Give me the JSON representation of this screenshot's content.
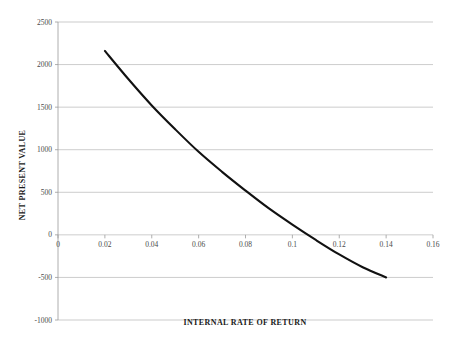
{
  "chart_data": {
    "type": "line",
    "title": "",
    "xlabel": "INTERNAL RATE OF RETURN",
    "ylabel": "NET PRESENT VALUE",
    "xlim": [
      0,
      0.16
    ],
    "ylim": [
      -1000,
      2500
    ],
    "grid": true,
    "legend": "none",
    "x_ticks": [
      "0",
      "0.02",
      "0.04",
      "0.06",
      "0.08",
      "0.1",
      "0.12",
      "0.14",
      "0.16"
    ],
    "x_tick_values": [
      0,
      0.02,
      0.04,
      0.06,
      0.08,
      0.1,
      0.12,
      0.14,
      0.16
    ],
    "y_ticks": [
      "2500",
      "2000",
      "1500",
      "1000",
      "500",
      "0",
      "-500",
      "-1000"
    ],
    "y_tick_values": [
      2500,
      2000,
      1500,
      1000,
      500,
      0,
      -500,
      -1000
    ],
    "series": [
      {
        "name": "Net Present Value",
        "color": "#111111",
        "x": [
          0.02,
          0.03,
          0.04,
          0.05,
          0.06,
          0.07,
          0.08,
          0.09,
          0.1,
          0.11,
          0.12,
          0.13,
          0.14
        ],
        "values": [
          2160,
          1830,
          1520,
          1240,
          975,
          740,
          520,
          310,
          120,
          -60,
          -230,
          -380,
          -500
        ]
      }
    ],
    "annotations": {
      "irr_crossing": 0.102
    }
  },
  "axis_titles": {
    "x": "INTERNAL RATE OF RETURN",
    "y": "NET PRESENT VALUE"
  }
}
